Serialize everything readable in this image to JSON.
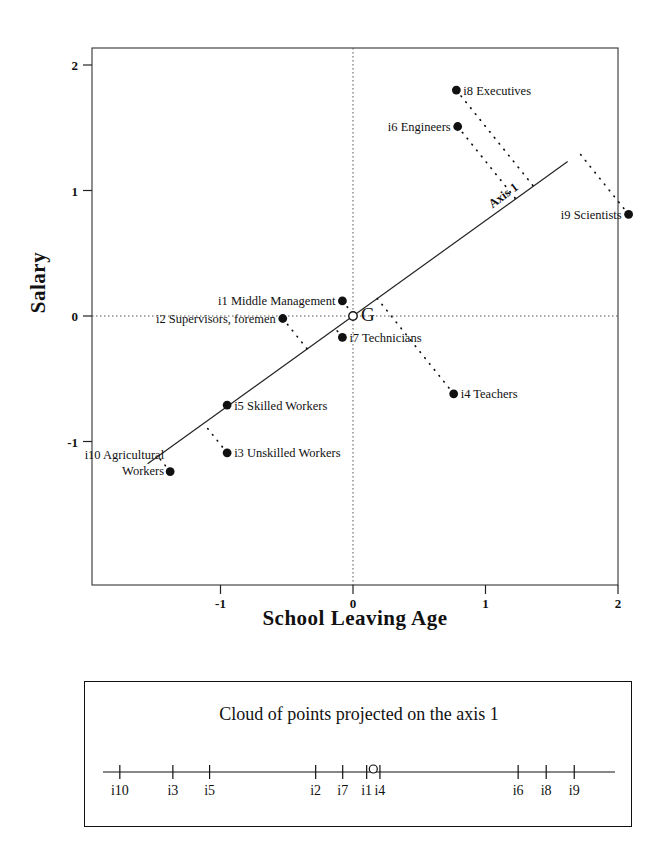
{
  "chart_data": {
    "type": "scatter",
    "title": "",
    "xlabel": "School Leaving Age",
    "ylabel": "Salary",
    "xlim": [
      -1.78,
      2.0
    ],
    "ylim": [
      -1.65,
      2.0
    ],
    "xticks": [
      -1,
      0,
      1,
      2
    ],
    "xtick_labels": [
      "-1",
      "0",
      "1",
      "2"
    ],
    "yticks": [
      -1,
      0,
      1,
      2
    ],
    "ytick_labels": [
      "-1",
      "0",
      "1",
      "2"
    ],
    "grid": "dotted zero-lines at x=0 and y=0",
    "legend": "none",
    "origin_label": "G",
    "axis_line_label": "Axis 1",
    "points": [
      {
        "id": "i1",
        "label": "i1 Middle Management",
        "x": -0.08,
        "y": 0.12,
        "label_side": "left"
      },
      {
        "id": "i2",
        "label": "i2 Supervisors, foremen",
        "x": -0.53,
        "y": -0.02,
        "label_side": "left"
      },
      {
        "id": "i3",
        "label": "i3 Unskilled Workers",
        "x": -0.95,
        "y": -1.09,
        "label_side": "right"
      },
      {
        "id": "i4",
        "label": "i4 Teachers",
        "x": 0.76,
        "y": -0.62,
        "label_side": "right"
      },
      {
        "id": "i5",
        "label": "i5 Skilled Workers",
        "x": -0.95,
        "y": -0.71,
        "label_side": "right"
      },
      {
        "id": "i6",
        "label": "i6 Engineers",
        "x": 0.79,
        "y": 1.51,
        "label_side": "left"
      },
      {
        "id": "i7",
        "label": "i7 Technicians",
        "x": -0.08,
        "y": -0.17,
        "label_side": "right"
      },
      {
        "id": "i8",
        "label": "i8 Executives",
        "x": 0.78,
        "y": 1.8,
        "label_side": "right"
      },
      {
        "id": "i9",
        "label": "i9 Scientists",
        "x": 2.08,
        "y": 0.81,
        "label_side": "left"
      },
      {
        "id": "i10",
        "label": "i10 Agricultural Workers",
        "x": -1.38,
        "y": -1.24,
        "label_side": "left"
      }
    ],
    "projection_axis": {
      "slope": 0.76,
      "note": "principal axis line through G"
    }
  },
  "panel": {
    "title": "Cloud of points projected on the axis 1",
    "origin_marker": "G",
    "ticks": [
      {
        "id": "i10",
        "pos": 0.033
      },
      {
        "id": "i3",
        "pos": 0.137
      },
      {
        "id": "i5",
        "pos": 0.209
      },
      {
        "id": "i2",
        "pos": 0.417
      },
      {
        "id": "i7",
        "pos": 0.47
      },
      {
        "id": "i1",
        "pos": 0.517
      },
      {
        "id": "i4",
        "pos": 0.543
      },
      {
        "id": "i6",
        "pos": 0.814
      },
      {
        "id": "i8",
        "pos": 0.869
      },
      {
        "id": "i9",
        "pos": 0.924
      }
    ],
    "origin_pos": 0.53
  }
}
